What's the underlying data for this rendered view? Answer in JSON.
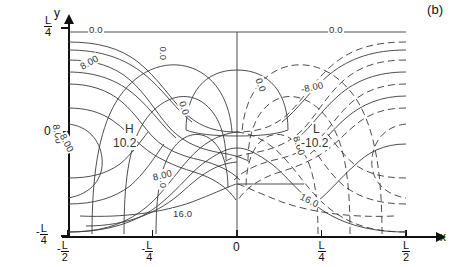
{
  "figure": {
    "panel_label": "(b)"
  },
  "axes": {
    "x_name": "x",
    "y_name": "y",
    "x_ticks": [
      {
        "id": "x-minus-l-over-2",
        "sign": "-",
        "num": "L",
        "den": "2",
        "pos": 0.0
      },
      {
        "id": "x-minus-l-over-4",
        "sign": "-",
        "num": "L",
        "den": "4",
        "pos": 0.25
      },
      {
        "id": "x-zero",
        "sign": "",
        "num": "0",
        "den": "",
        "pos": 0.5
      },
      {
        "id": "x-l-over-4",
        "sign": "",
        "num": "L",
        "den": "4",
        "pos": 0.75
      },
      {
        "id": "x-l-over-2",
        "sign": "",
        "num": "L",
        "den": "2",
        "pos": 1.0
      }
    ],
    "y_ticks": [
      {
        "id": "y-l-over-4",
        "sign": "",
        "num": "L",
        "den": "4",
        "pos": 1.0
      },
      {
        "id": "y-zero",
        "sign": "",
        "num": "0",
        "den": "",
        "pos": 0.5
      },
      {
        "id": "y-minus-l-over-4",
        "sign": "-",
        "num": "L",
        "den": "4",
        "pos": 0.0
      }
    ]
  },
  "chart_data": {
    "type": "contour",
    "title": "",
    "subtitle": "",
    "xlabel": "x",
    "ylabel": "y",
    "xlim": [
      "-L/2",
      "L/2"
    ],
    "ylim": [
      "-L/4",
      "L/4"
    ],
    "xtick_labels": [
      "-L/2",
      "-L/4",
      "0",
      "L/4",
      "L/2"
    ],
    "ytick_labels": [
      "L/4",
      "0",
      "-L/4"
    ],
    "grid": false,
    "legend": "none",
    "contour_levels": [
      -16.0,
      -8.0,
      0.0,
      8.0,
      16.0
    ],
    "line_styles": {
      "positive": "solid",
      "zero": "solid",
      "negative": "dashed"
    },
    "extrema": [
      {
        "type": "high",
        "letter": "H",
        "value": "10.2",
        "x": "-L/4",
        "y": "0"
      },
      {
        "type": "low",
        "letter": "L",
        "value": "-10.2",
        "x": "L/4",
        "y": "0"
      }
    ],
    "annotations": [
      {
        "id": "zero-top-left",
        "text": "0.0",
        "level": 0.0,
        "rotation": 0
      },
      {
        "id": "zero-top-right",
        "text": "0.0",
        "level": 0.0,
        "rotation": 0
      },
      {
        "id": "zero-center-top",
        "text": "0.0",
        "level": 0.0,
        "rotation": 90
      },
      {
        "id": "zero-center-bottom",
        "text": "0.0",
        "level": 0.0,
        "rotation": 90
      },
      {
        "id": "zero-left-mid",
        "text": "0.0",
        "level": 0.0,
        "rotation": 65
      },
      {
        "id": "zero-right-mid",
        "text": "0.0",
        "level": 0.0,
        "rotation": 65
      },
      {
        "id": "eight-upper-left",
        "text": "8.00",
        "level": 8.0,
        "rotation": -28
      },
      {
        "id": "eight-left-lower",
        "text": "8.00",
        "level": 8.0,
        "rotation": 78
      },
      {
        "id": "eight-mid-left",
        "text": "8.00",
        "level": 8.0,
        "rotation": 60
      },
      {
        "id": "eight-lower-center",
        "text": "8.00",
        "level": 8.0,
        "rotation": -18
      },
      {
        "id": "eight-right",
        "text": "8.00",
        "level": 8.0,
        "rotation": 72
      },
      {
        "id": "minus-eight-right",
        "text": "-8.00",
        "level": -8.0,
        "rotation": -12
      },
      {
        "id": "sixteen-bottom-left",
        "text": "16.0",
        "level": 16.0,
        "rotation": 0
      },
      {
        "id": "sixteen-bottom-right",
        "text": "16.0",
        "level": 16.0,
        "rotation": 26
      }
    ]
  }
}
